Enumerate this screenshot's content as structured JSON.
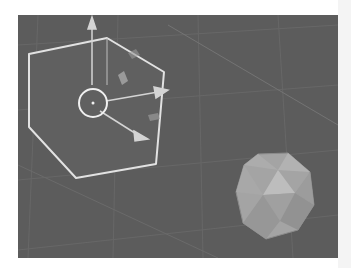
{
  "viewport": {
    "type": "3d-viewport",
    "background": "#5c5c5c",
    "grid_color": "#6a6a6a",
    "objects": [
      {
        "name": "Cube",
        "selected": true,
        "outline_color": "#e6e6e6"
      },
      {
        "name": "Icosphere",
        "selected": false,
        "fill_color": "#a8a8a8"
      }
    ],
    "gizmo": {
      "mode": "translate",
      "axes": [
        "x",
        "y",
        "z"
      ],
      "arrow_color": "#d8d8d8",
      "center_ring_color": "#f0f0f0"
    }
  }
}
